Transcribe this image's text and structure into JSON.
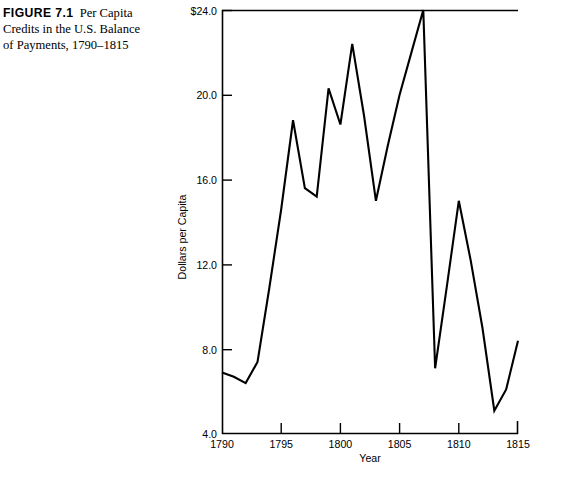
{
  "figure": {
    "label": "FIGURE 7.1",
    "caption": "Per Capita Credits in the U.S. Balance of Payments, 1790–1815",
    "caption_line1": "Per",
    "caption_line2": "Capita Credits in the",
    "caption_line3": "U.S. Balance of",
    "caption_line4": "Payments, 1790–1815"
  },
  "source_note": "",
  "colors": {
    "line": "#000000",
    "axis": "#000000",
    "background": "#ffffff",
    "text": "#000000"
  },
  "axes": {
    "x_title": "Year",
    "y_title": "Dollars per Capita",
    "x_ticks": [
      "1790",
      "1795",
      "1800",
      "1805",
      "1810",
      "1815"
    ],
    "y_ticks": [
      "$24.0",
      "20.0",
      "16.0",
      "12.0",
      "8.0",
      "4.0"
    ]
  },
  "chart_data": {
    "type": "line",
    "xlabel": "Year",
    "ylabel": "Dollars per Capita",
    "xlim": [
      1790,
      1815
    ],
    "ylim": [
      4.0,
      24.0
    ],
    "xticks": [
      1790,
      1795,
      1800,
      1805,
      1810,
      1815
    ],
    "xticklabels": [
      "1790",
      "1795",
      "1800",
      "1805",
      "1810",
      "1815"
    ],
    "yticks": [
      4.0,
      8.0,
      12.0,
      16.0,
      20.0,
      24.0
    ],
    "yticklabels": [
      "4.0",
      "8.0",
      "12.0",
      "16.0",
      "20.0",
      "$24.0"
    ],
    "grid": false,
    "legend": false,
    "units": "dollars per capita",
    "series": [
      {
        "name": "Per capita credits",
        "color": "#000000",
        "x": [
          1790,
          1791,
          1792,
          1793,
          1794,
          1795,
          1796,
          1797,
          1798,
          1799,
          1800,
          1801,
          1802,
          1803,
          1804,
          1805,
          1806,
          1807,
          1808,
          1809,
          1810,
          1811,
          1812,
          1813,
          1814,
          1815
        ],
        "values": [
          6.9,
          6.7,
          6.4,
          7.4,
          10.9,
          14.6,
          18.8,
          15.6,
          15.2,
          20.3,
          18.6,
          22.4,
          19.0,
          15.0,
          17.6,
          20.0,
          22.0,
          24.0,
          7.1,
          11.0,
          15.0,
          12.2,
          9.0,
          5.1,
          6.1,
          8.4
        ]
      }
    ],
    "annotations": []
  }
}
